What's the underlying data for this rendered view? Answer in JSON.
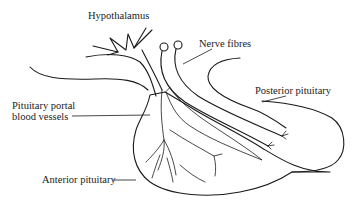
{
  "diagram": {
    "labels": {
      "hypothalamus": "Hypothalamus",
      "nerve_fibres": "Nerve fibres",
      "posterior_pituitary": "Posterior pituitary",
      "portal_vessels_line1": "Pituitary portal",
      "portal_vessels_line2": "blood vessels",
      "anterior_pituitary": "Anterior pituitary"
    },
    "colors": {
      "ink": "#1a1a1a",
      "background": "#ffffff"
    }
  }
}
